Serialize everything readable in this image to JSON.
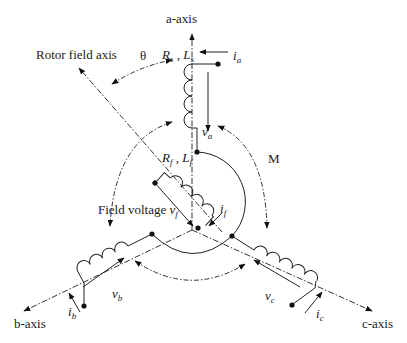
{
  "diagram": {
    "title": "",
    "axes": {
      "a": "a-axis",
      "b": "b-axis",
      "c": "c-axis",
      "rotor": "Rotor field axis"
    },
    "labels": {
      "theta": "θ",
      "mutual": "M",
      "field_voltage_text": "Field voltage ",
      "stator_params": {
        "R": "R",
        "R_sub": "s",
        "sep": " , ",
        "L": "L",
        "L_sub": "s"
      },
      "field_params": {
        "R": "R",
        "R_sub": "f",
        "sep": " , ",
        "L": "L",
        "L_sub": "f"
      },
      "currents": {
        "ia": {
          "base": "i",
          "sub": "a"
        },
        "ib": {
          "base": "i",
          "sub": "b"
        },
        "ic": {
          "base": "i",
          "sub": "c"
        },
        "if": {
          "base": "i",
          "sub": "f"
        }
      },
      "voltages": {
        "va": {
          "base": "v",
          "sub": "a"
        },
        "vb": {
          "base": "v",
          "sub": "b"
        },
        "vc": {
          "base": "v",
          "sub": "c"
        },
        "vf": {
          "base": "v",
          "sub": "f"
        }
      }
    }
  }
}
